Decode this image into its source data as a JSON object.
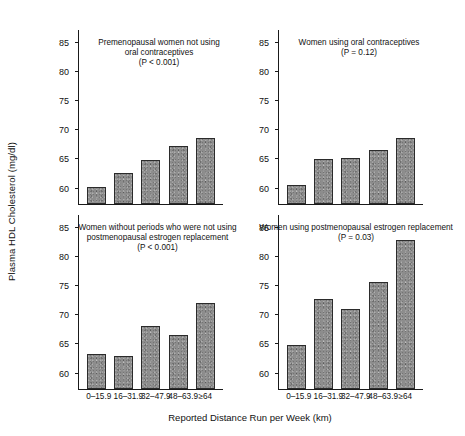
{
  "chart_data": {
    "type": "bar",
    "title": "",
    "xlabel": "Reported Distance Run per Week (km)",
    "ylabel": "Plasma HDL Cholesterol (mg/dl)",
    "categories": [
      "0–15.9",
      "16–31.9",
      "32–47.9",
      "48–63.9",
      "≥64"
    ],
    "ylim": [
      57,
      87
    ],
    "yticks": [
      60,
      65,
      70,
      75,
      80,
      85
    ],
    "grid": false,
    "legend": "none",
    "bar_color": "#8d8d8d",
    "bar_edge_color": "#2b2b2b",
    "panels": [
      {
        "id": "premenopausal-not-using-oc",
        "position": "top-left",
        "title": "Premenopausal women not using\noral contraceptives\n(P < 0.001)",
        "p_value": "P < 0.001",
        "values": [
          60.0,
          62.4,
          64.6,
          66.9,
          68.4
        ]
      },
      {
        "id": "women-using-oc",
        "position": "top-right",
        "title": "Women using oral contraceptives\n(P = 0.12)",
        "p_value": "P = 0.12",
        "values": [
          60.3,
          64.8,
          64.9,
          66.2,
          68.3
        ]
      },
      {
        "id": "no-periods-not-using-estrogen",
        "position": "bottom-left",
        "title": "Women without periods who were not using\npostmenopausal estrogen replacement\n(P < 0.001)",
        "p_value": "P < 0.001",
        "values": [
          63.0,
          62.6,
          67.8,
          66.2,
          71.8
        ]
      },
      {
        "id": "using-postmenopausal-estrogen",
        "position": "bottom-right",
        "title": "Women using postmenopausal estrogen replacement\n(P = 0.03)",
        "p_value": "P = 0.03",
        "values": [
          64.5,
          72.5,
          70.7,
          75.3,
          82.5
        ]
      }
    ]
  }
}
